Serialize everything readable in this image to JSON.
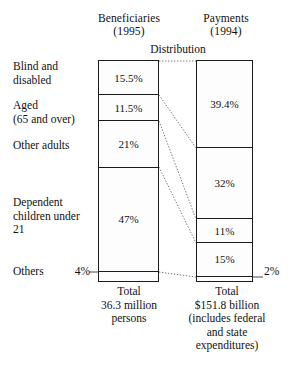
{
  "header": {
    "left_column_title": "Beneficiaries",
    "left_column_year": "(1995)",
    "right_column_title": "Payments",
    "right_column_year": "(1994)",
    "distribution_label": "Distribution"
  },
  "categories": [
    {
      "label": "Blind and\ndisabled"
    },
    {
      "label": "Aged\n(65 and over)"
    },
    {
      "label": "Other adults"
    },
    {
      "label": "Dependent\nchildren under\n21"
    },
    {
      "label": "Others"
    }
  ],
  "callouts": {
    "others_beneficiaries_pct": "4%",
    "others_payments_pct": "2%"
  },
  "footer": {
    "left_total": "Total\n36.3 million\npersons",
    "right_total": "Total\n$151.8 billion\n(includes federal\nand state\nexpenditures)"
  },
  "colors": {
    "ink": "#111111",
    "rule": "#1a1a1a",
    "stipple": "#4a4a4a",
    "background": "#ffffff"
  },
  "chart_data": {
    "type": "bar",
    "title": "Distribution",
    "subtitle": "",
    "xlabel": "",
    "ylabel": "",
    "ylim": [
      0,
      100
    ],
    "grid": false,
    "legend_position": "left-labels",
    "categories": [
      "Blind and disabled",
      "Aged (65 and over)",
      "Other adults",
      "Dependent children under 21",
      "Others"
    ],
    "series": [
      {
        "name": "Beneficiaries (1995)",
        "unit": "percent",
        "total_label": "36.3 million persons",
        "values": [
          15.5,
          11.5,
          21,
          47,
          4
        ],
        "value_labels": [
          "15.5%",
          "11.5%",
          "21%",
          "47%",
          "4%"
        ]
      },
      {
        "name": "Payments (1994)",
        "unit": "percent",
        "total_label": "$151.8 billion (includes federal and state expenditures)",
        "values": [
          39.4,
          32,
          11,
          15,
          2
        ],
        "value_labels": [
          "39.4%",
          "32%",
          "11%",
          "15%",
          "2%"
        ]
      }
    ],
    "annotations": [
      "Total 36.3 million persons",
      "Total $151.8 billion (includes federal and state expenditures)"
    ]
  }
}
